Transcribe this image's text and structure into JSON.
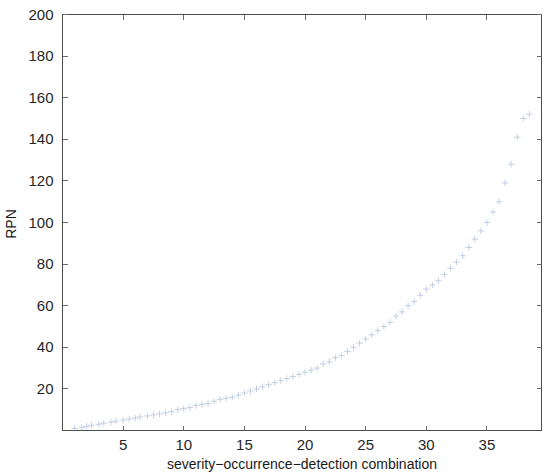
{
  "figure": {
    "background_color": "#ffffff",
    "axes_color": "#4d4d4d",
    "marker_color": "#8fa8c8",
    "marker_symbol": "plus-cross"
  },
  "chart_data": {
    "type": "scatter",
    "title": "",
    "xlabel": "severity−occurrence−detection combination",
    "ylabel": "RPN",
    "xlim": [
      0,
      39.5
    ],
    "ylim": [
      0,
      200
    ],
    "xticks": [
      5,
      10,
      15,
      20,
      25,
      30,
      35
    ],
    "xticklabels": [
      "5",
      "10",
      "15",
      "20",
      "25",
      "30",
      "35"
    ],
    "yticks": [
      20,
      40,
      60,
      80,
      100,
      120,
      140,
      160,
      180,
      200
    ],
    "yticklabels": [
      "20",
      "40",
      "60",
      "80",
      "100",
      "120",
      "140",
      "160",
      "180",
      "200"
    ],
    "grid": false,
    "legend": null,
    "legend_position": "none",
    "series": [
      {
        "name": "RPN",
        "marker": "+",
        "color": "#8fa8c8",
        "x": [
          1,
          1.6,
          2,
          2.4,
          3,
          3.4,
          4,
          4.4,
          5,
          5.5,
          6,
          6.4,
          7,
          7.5,
          8,
          8.5,
          9,
          9.5,
          10,
          10.5,
          11,
          11.5,
          12,
          12.5,
          13,
          13.5,
          14,
          14.5,
          15,
          15.5,
          16,
          16.5,
          17,
          17.5,
          18,
          18.5,
          19,
          19.5,
          20,
          20.5,
          21,
          21.5,
          22,
          22.5,
          23,
          23.5,
          24,
          24.5,
          25,
          25.5,
          26,
          26.5,
          27,
          27.5,
          28,
          28.5,
          29,
          29.5,
          30,
          30.5,
          31,
          31.5,
          32,
          32.5,
          33,
          33.5,
          34,
          34.5,
          35,
          35.5,
          36,
          36.5,
          37,
          37.5,
          38,
          38.5
        ],
        "y": [
          1,
          1.5,
          2,
          2.5,
          3,
          3.5,
          4,
          4.5,
          5,
          5.5,
          6,
          6.5,
          7,
          7.5,
          8,
          8.5,
          9,
          10,
          10.5,
          11,
          12,
          12.5,
          13,
          14,
          15,
          15.5,
          16,
          17,
          18,
          19,
          20,
          21,
          22,
          23,
          24,
          25,
          26,
          27,
          28,
          29,
          30,
          32,
          33,
          35,
          36,
          38,
          40,
          42,
          44,
          46,
          48,
          50,
          52,
          55,
          57,
          60,
          62,
          65,
          68,
          70,
          72,
          75,
          78,
          81,
          84,
          88,
          92,
          96,
          100,
          105,
          110,
          119,
          128,
          141,
          150,
          152
        ]
      }
    ]
  }
}
